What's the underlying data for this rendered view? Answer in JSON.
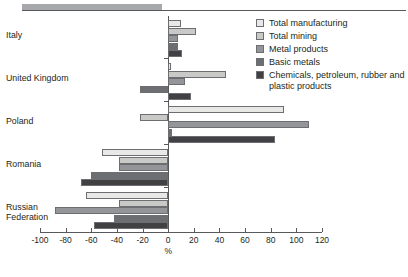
{
  "chart_data": {
    "type": "bar",
    "orientation": "horizontal",
    "title": "",
    "subtitle": "",
    "xlabel": "%",
    "ylabel": "",
    "xlim": [
      -100,
      120
    ],
    "xticks": [
      -100,
      -80,
      -60,
      -40,
      -20,
      0,
      20,
      40,
      60,
      80,
      100,
      120
    ],
    "xtick_labels": [
      "-100",
      "-80",
      "-60",
      "-40",
      "-20",
      "0",
      "20",
      "40",
      "60",
      "80",
      "100",
      "120"
    ],
    "grid": false,
    "legend_position": "top-right",
    "categories": [
      "Italy",
      "United Kingdom",
      "Poland",
      "Romania",
      "Russian\nFederation"
    ],
    "series": [
      {
        "name": "Total manufacturing",
        "color": "#e8e8e6",
        "values": [
          10,
          2,
          90,
          -52,
          -64
        ]
      },
      {
        "name": "Total mining",
        "color": "#c9cac8",
        "values": [
          22,
          45,
          -22,
          -38,
          -38
        ]
      },
      {
        "name": "Metal products",
        "color": "#939598",
        "values": [
          8,
          13,
          110,
          -38,
          -88
        ]
      },
      {
        "name": "Basic metals",
        "color": "#6d6e71",
        "values": [
          8,
          -22,
          3,
          -60,
          -42
        ]
      },
      {
        "name": "Chemicals, petroleum, rubber and plastic products",
        "color": "#414042",
        "values": [
          11,
          18,
          83,
          -68,
          -58
        ]
      }
    ],
    "legend_entries": [
      {
        "label": "Total manufacturing",
        "color": "#e8e8e6"
      },
      {
        "label": "Total mining",
        "color": "#c9cac8"
      },
      {
        "label": "Metal products",
        "color": "#939598"
      },
      {
        "label": "Basic metals",
        "color": "#6d6e71"
      },
      {
        "label": "Chemicals, petroleum, rubber and plastic products",
        "color": "#414042"
      }
    ],
    "axis_unit_label": "%"
  },
  "decor": {
    "header_band_color": "#a6a8ab",
    "axis_color": "#58595b"
  }
}
